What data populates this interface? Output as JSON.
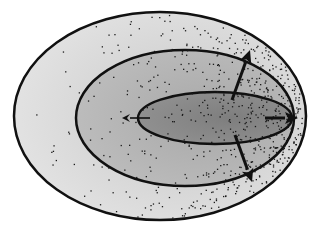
{
  "diagram": {
    "type": "nested-ellipses-with-scatter",
    "colors": {
      "outer_fill": "#dcdcdc",
      "middle_fill": "#b4b4b4",
      "inner_fill": "#8a8a8a",
      "stroke": "#111111",
      "dots": "#1a1a1a"
    },
    "ellipses": [
      {
        "name": "outer",
        "cx": 160,
        "cy": 116,
        "rx": 146,
        "ry": 104
      },
      {
        "name": "middle",
        "cx": 185,
        "cy": 118,
        "rx": 109,
        "ry": 68
      },
      {
        "name": "inner",
        "cx": 215,
        "cy": 118,
        "rx": 77,
        "ry": 26
      }
    ],
    "arrows": [
      {
        "name": "up-right-arrow",
        "x1": 232,
        "y1": 100,
        "x2": 250,
        "y2": 50,
        "weight": "bold"
      },
      {
        "name": "right-arrow",
        "x1": 265,
        "y1": 118,
        "x2": 298,
        "y2": 118,
        "weight": "bold"
      },
      {
        "name": "down-right-arrow",
        "x1": 235,
        "y1": 135,
        "x2": 252,
        "y2": 182,
        "weight": "bold"
      },
      {
        "name": "left-arrow",
        "x1": 150,
        "y1": 118,
        "x2": 122,
        "y2": 118,
        "weight": "thin"
      }
    ],
    "scatter_note": "dense points skewed to right side"
  }
}
